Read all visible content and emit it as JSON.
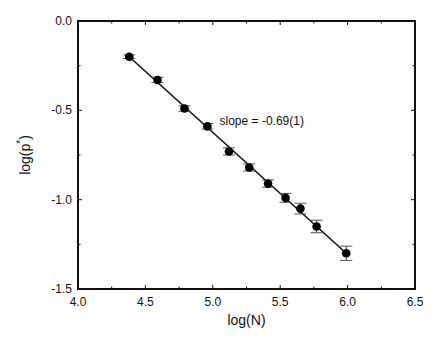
{
  "chart_data": {
    "type": "scatter",
    "title": "",
    "xlabel": "log(N)",
    "ylabel": "log(p*)",
    "ylabel_base": "log(p",
    "ylabel_sup": "*",
    "ylabel_close": ")",
    "xlim": [
      4.0,
      6.5
    ],
    "ylim": [
      -1.5,
      0.0
    ],
    "x_ticks": [
      4.0,
      4.5,
      5.0,
      5.5,
      6.0,
      6.5
    ],
    "x_tick_labels": [
      "4.0",
      "4.5",
      "5.0",
      "5.5",
      "6.0",
      "6.5"
    ],
    "y_ticks": [
      0.0,
      -0.5,
      -1.0,
      -1.5
    ],
    "y_tick_labels": [
      "0.0",
      "-0.5",
      "-1.0",
      "-1.5"
    ],
    "grid": false,
    "legend": null,
    "series": [
      {
        "name": "data",
        "marker": "filled-circle",
        "x": [
          4.38,
          4.59,
          4.79,
          4.96,
          5.12,
          5.27,
          5.41,
          5.54,
          5.65,
          5.77,
          5.99
        ],
        "y": [
          -0.2,
          -0.33,
          -0.49,
          -0.59,
          -0.73,
          -0.82,
          -0.91,
          -0.99,
          -1.05,
          -1.15,
          -1.3
        ],
        "yerr": [
          0.01,
          0.015,
          0.015,
          0.015,
          0.02,
          0.02,
          0.02,
          0.025,
          0.03,
          0.035,
          0.04
        ]
      }
    ],
    "fit_line": {
      "x": [
        4.38,
        5.99
      ],
      "y": [
        -0.2,
        -1.3
      ],
      "slope": -0.69
    },
    "annotations": [
      {
        "text": "slope = -0.69(1)",
        "x": 5.05,
        "y": -0.58
      }
    ]
  },
  "labels": {
    "annotation": "slope = -0.69(1)",
    "xlabel": "log(N)"
  }
}
